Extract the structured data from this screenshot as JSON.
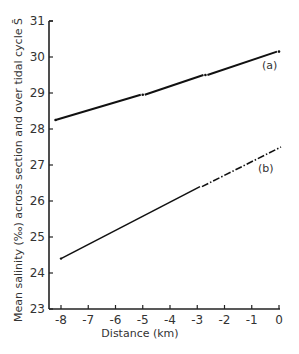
{
  "chart_data": {
    "type": "line",
    "title": "",
    "xlabel": "Distance (km)",
    "ylabel": "Mean salinity (‰) across section and over tidal cycle S̄",
    "xlim": [
      -8.2,
      0
    ],
    "ylim": [
      23,
      31
    ],
    "x_ticks": [
      "-8",
      "-7",
      "-6",
      "-5",
      "-4",
      "-3",
      "-2",
      "-1",
      "0"
    ],
    "y_ticks": [
      "23",
      "24",
      "25",
      "26",
      "27",
      "28",
      "29",
      "30",
      "31"
    ],
    "grid": false,
    "legend": "inline labels",
    "series": [
      {
        "name": "(a)",
        "x": [
          -8.2,
          -5.0,
          -2.7,
          0
        ],
        "values": [
          28.25,
          28.95,
          29.5,
          30.15
        ],
        "style": "solid with dot markers at breaks"
      },
      {
        "name": "(b)",
        "x": [
          -8.0,
          -2.9,
          0
        ],
        "values": [
          24.4,
          26.4,
          27.5
        ],
        "style": "solid to -2.9 km, dash-dot extrapolation to 0 km"
      }
    ]
  },
  "labels": {
    "series_a": "(a)",
    "series_b": "(b)",
    "xlabel": "Distance (km)",
    "ylabel": "Mean salinity (‰) across section and over tidal cycle S̄"
  }
}
